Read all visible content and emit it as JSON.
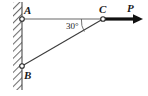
{
  "figure": {
    "type": "statics-free-body-diagram",
    "background_color": "#ffffff",
    "labels": {
      "point_a": "A",
      "point_b": "B",
      "point_c": "C",
      "force": "P",
      "angle": "30°"
    },
    "colors": {
      "member_ac": "#9a9a9a",
      "member_bc": "#3c3c3c",
      "wall_hatch": "#6e6e6e",
      "force_arrow": "#111111",
      "joint_outline": "#2a2a2a",
      "text": "#1a1a1a"
    },
    "geometry": {
      "wall_left_x": 13,
      "wall_right_x": 22,
      "wall_top_y": 2,
      "wall_bottom_y": 90,
      "joint_a": [
        22,
        19
      ],
      "joint_b": [
        22,
        66
      ],
      "joint_c": [
        103,
        19
      ],
      "force_arrow_start": [
        103,
        19
      ],
      "force_arrow_tip": [
        142,
        19
      ],
      "angle_arc_radius": 22
    }
  }
}
